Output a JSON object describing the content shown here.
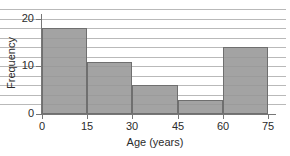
{
  "chart_data": {
    "type": "bar",
    "title": "",
    "subtitle": "",
    "xlabel": "Age (years)",
    "ylabel": "Frequency",
    "categories": [
      "0-15",
      "15-30",
      "30-45",
      "45-60",
      "60-75"
    ],
    "bin_edges": [
      0,
      15,
      30,
      45,
      60,
      75
    ],
    "values": [
      18,
      11,
      6,
      3,
      14
    ],
    "x": [
      0,
      15,
      30,
      45,
      60,
      75
    ],
    "xlim": [
      0,
      75
    ],
    "ylim": [
      0,
      21
    ],
    "xticks": [
      "0",
      "15",
      "30",
      "45",
      "60",
      "75"
    ],
    "yticks": [
      "0",
      "10",
      "20"
    ],
    "ytick_values": [
      0,
      10,
      20
    ],
    "gridlines": [
      2,
      4,
      6,
      8,
      10,
      12,
      14,
      16,
      18,
      20,
      22
    ],
    "grid": "horizontal",
    "legend": "none",
    "annotations": [],
    "colors": {
      "bar_fill": "#969696",
      "bar_border": "#6f6f6f",
      "gridline": "#b9b9b9",
      "axis": "#777777",
      "text": "#2b2b2b",
      "background": "#ffffff"
    }
  }
}
